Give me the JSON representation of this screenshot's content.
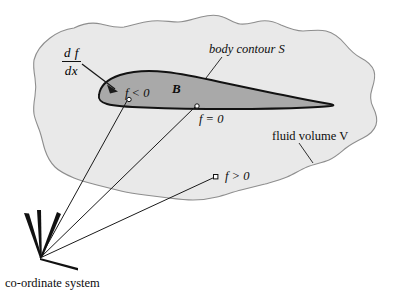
{
  "figure": {
    "title_caption": "co-ordinate system",
    "colors": {
      "fluid_fill": "#e9e9e9",
      "fluid_stroke": "#8e8e8e",
      "body_fill": "#a9a9a9",
      "body_stroke": "#121212",
      "line": "#1a1a1a",
      "text": "#0d0d0d",
      "marker_fill": "#ffffff",
      "background": "#ffffff"
    },
    "labels": {
      "derivative_numerator": "d f",
      "derivative_denominator": "dx",
      "body_contour": "body contour S",
      "body_region": "B",
      "f_negative": "f < 0",
      "f_zero": "f = 0",
      "f_positive": "f > 0",
      "fluid_volume": "fluid volume V",
      "coordinate_system": "co-ordinate system"
    }
  }
}
